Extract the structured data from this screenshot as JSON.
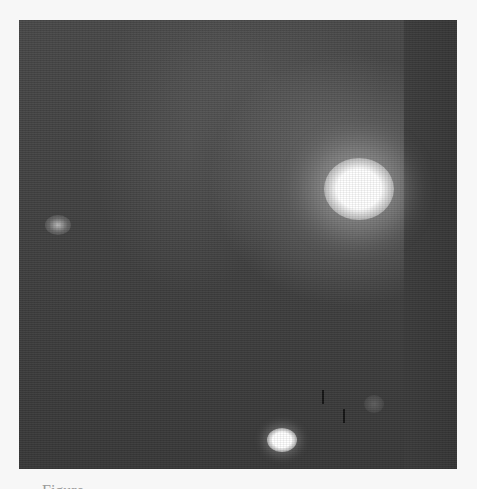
{
  "figure": {
    "type": "grayscale micrograph",
    "features": [
      {
        "name": "large-bright-spot",
        "approx_center": [
          340,
          180
        ]
      },
      {
        "name": "small-bright-spot",
        "approx_center": [
          282,
          440
        ]
      },
      {
        "name": "dim-spot",
        "approx_center": [
          58,
          225
        ]
      },
      {
        "name": "vertical-band",
        "approx_x_range": [
          404,
          457
        ]
      }
    ]
  },
  "caption": {
    "text": "Figure",
    "clipped": true
  }
}
